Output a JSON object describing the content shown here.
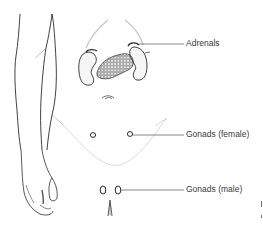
{
  "figure": {
    "labels": {
      "adrenals": "Adrenals",
      "gonads_female": "Gonads (female)",
      "gonads_male": "Gonads (male)"
    },
    "colors": {
      "ink": "#2b2b2b",
      "leader_line": "#555555",
      "label_text": "#3a3a3a",
      "faint_outline": "#c8c8c8",
      "background": "#ffffff"
    }
  }
}
